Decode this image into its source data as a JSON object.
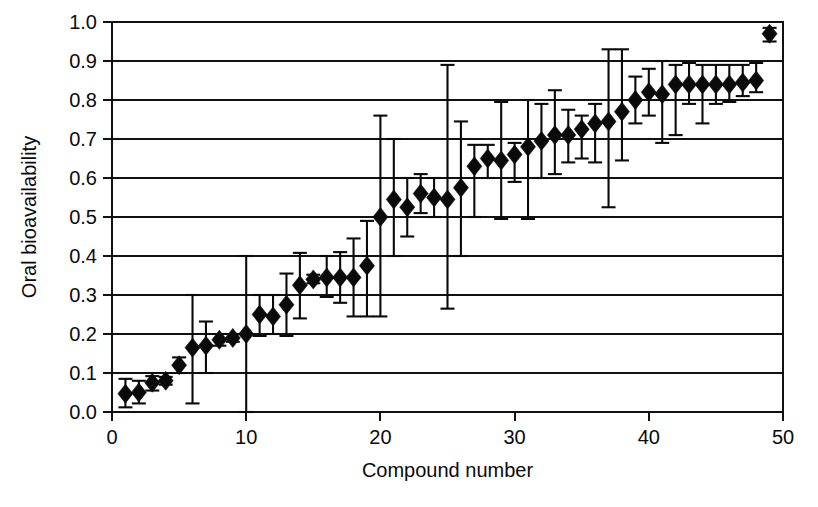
{
  "chart_data": {
    "type": "scatter",
    "title": "",
    "xlabel": "Compound number",
    "ylabel": "Oral bioavailability",
    "xlim": [
      0,
      50
    ],
    "ylim": [
      0.0,
      1.0
    ],
    "xticks": [
      0,
      10,
      20,
      30,
      40,
      50
    ],
    "xtick_labels": [
      "0",
      "10",
      "20",
      "30",
      "40",
      "50"
    ],
    "yticks": [
      0.0,
      0.1,
      0.2,
      0.3,
      0.4,
      0.5,
      0.6,
      0.7,
      0.8,
      0.9,
      1.0
    ],
    "ytick_labels": [
      "0.0",
      "0.1",
      "0.2",
      "0.3",
      "0.4",
      "0.5",
      "0.6",
      "0.7",
      "0.8",
      "0.9",
      "1.0"
    ],
    "grid": "horizontal",
    "legend": "none",
    "marker": "filled-diamond",
    "errorbars": "vertical-with-caps",
    "series": [
      {
        "name": "Oral bioavailability",
        "x": [
          1,
          2,
          3,
          4,
          5,
          6,
          7,
          8,
          9,
          10,
          11,
          12,
          13,
          14,
          15,
          16,
          17,
          18,
          19,
          20,
          21,
          22,
          23,
          24,
          25,
          26,
          27,
          28,
          29,
          30,
          31,
          32,
          33,
          34,
          35,
          36,
          37,
          38,
          39,
          40,
          41,
          42,
          43,
          44,
          45,
          46,
          47,
          48,
          49
        ],
        "values": [
          0.047,
          0.05,
          0.075,
          0.08,
          0.12,
          0.165,
          0.17,
          0.185,
          0.19,
          0.2,
          0.25,
          0.245,
          0.275,
          0.325,
          0.34,
          0.345,
          0.345,
          0.345,
          0.375,
          0.5,
          0.545,
          0.525,
          0.56,
          0.55,
          0.545,
          0.575,
          0.63,
          0.65,
          0.645,
          0.66,
          0.68,
          0.695,
          0.71,
          0.71,
          0.725,
          0.74,
          0.745,
          0.77,
          0.8,
          0.82,
          0.815,
          0.84,
          0.84,
          0.84,
          0.84,
          0.84,
          0.845,
          0.85,
          0.97
        ],
        "lower": [
          0.012,
          0.022,
          0.055,
          0.07,
          0.1,
          0.022,
          0.1,
          0.17,
          0.18,
          0.0,
          0.195,
          0.2,
          0.195,
          0.24,
          0.33,
          0.295,
          0.28,
          0.245,
          0.245,
          0.245,
          0.4,
          0.45,
          0.51,
          0.5,
          0.265,
          0.4,
          0.5,
          0.6,
          0.495,
          0.59,
          0.495,
          0.6,
          0.61,
          0.64,
          0.65,
          0.64,
          0.525,
          0.645,
          0.74,
          0.76,
          0.69,
          0.71,
          0.79,
          0.74,
          0.79,
          0.795,
          0.81,
          0.82,
          0.95
        ],
        "upper": [
          0.085,
          0.08,
          0.092,
          0.09,
          0.14,
          0.3,
          0.232,
          0.2,
          0.2,
          0.4,
          0.3,
          0.3,
          0.355,
          0.408,
          0.352,
          0.4,
          0.41,
          0.445,
          0.49,
          0.76,
          0.7,
          0.6,
          0.61,
          0.6,
          0.89,
          0.745,
          0.685,
          0.685,
          0.795,
          0.69,
          0.8,
          0.79,
          0.825,
          0.775,
          0.76,
          0.79,
          0.93,
          0.93,
          0.86,
          0.88,
          0.9,
          0.89,
          0.895,
          0.89,
          0.89,
          0.89,
          0.89,
          0.895,
          0.985
        ]
      }
    ]
  },
  "axes": {
    "ylabel": "Oral bioavailability",
    "xlabel": "Compound number"
  },
  "caption": {
    "fragment": ""
  }
}
